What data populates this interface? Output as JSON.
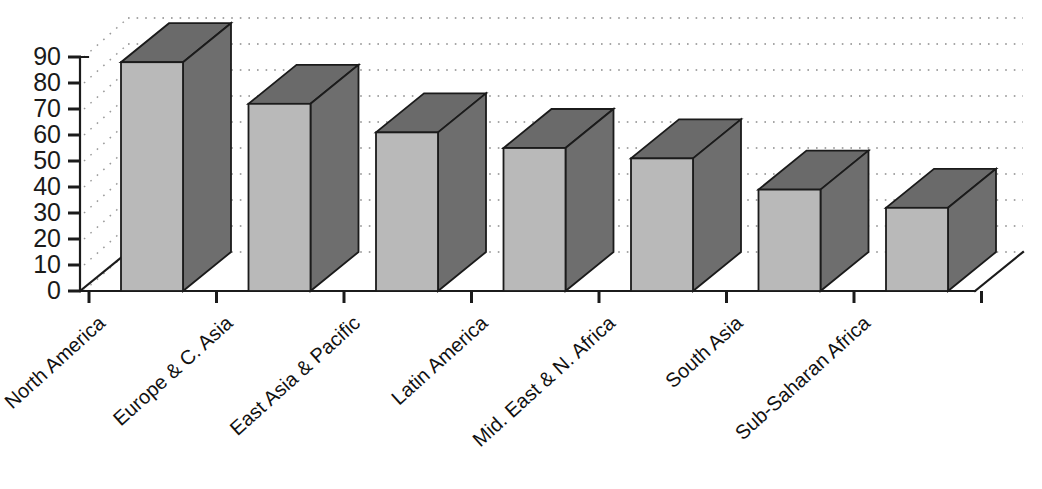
{
  "chart_data": {
    "type": "bar",
    "title": "",
    "subtitle": "",
    "xlabel": "",
    "ylabel": "",
    "categories": [
      "North America",
      "Europe & C. Asia",
      "East Asia & Pacific",
      "Latin America",
      "Mid. East & N. Africa",
      "South Asia",
      "Sub-Saharan Africa"
    ],
    "values": [
      88,
      72,
      61,
      55,
      51,
      39,
      32
    ],
    "ylim": [
      0,
      90
    ],
    "ytick_labels": [
      "90",
      "80",
      "70",
      "60",
      "50",
      "40",
      "30",
      "20",
      "10",
      "0"
    ],
    "ytick_values": [
      90,
      80,
      70,
      60,
      50,
      40,
      30,
      20,
      10,
      0
    ],
    "grid": true,
    "grid_style": "dotted-horizontal",
    "legend": "none",
    "legend_position": "none",
    "style": "3d-column",
    "annotations": []
  },
  "colors": {
    "bar_front": "#b9b9b9",
    "bar_side": "#6e6e6e",
    "bar_top": "#6a6a6a",
    "axis": "#1b1b1b",
    "grid": "#8a8a8a",
    "background": "#ffffff",
    "text": "#111111"
  }
}
